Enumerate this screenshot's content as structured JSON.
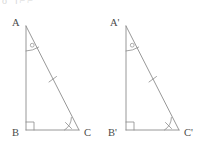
{
  "page": {
    "top_text_fragment": "o  ।⌐⌐"
  },
  "figure": {
    "stroke_color": "#8c8c8c",
    "label_color": "#4a4a4a",
    "background_color": "#ffffff",
    "triangles": [
      {
        "name": "triangle-abc",
        "vertices": {
          "apex": {
            "label": "A",
            "x": 26,
            "y": 26
          },
          "right_angle": {
            "label": "B",
            "x": 26,
            "y": 130
          },
          "base_right": {
            "label": "C",
            "x": 79,
            "y": 130
          }
        },
        "labels": {
          "apex_label": "A",
          "right_angle_label": "B",
          "base_right_label": "C"
        },
        "marks": {
          "apex_angle_mark": "arc-with-circle",
          "right_angle_mark": "square",
          "base_angle_mark": "arc-with-tick",
          "hypotenuse_mark": "single-tick"
        }
      },
      {
        "name": "triangle-a-prime-b-prime-c-prime",
        "vertices": {
          "apex": {
            "label": "A'",
            "x": 126,
            "y": 26
          },
          "right_angle": {
            "label": "B'",
            "x": 126,
            "y": 130
          },
          "base_right": {
            "label": "C'",
            "x": 179,
            "y": 130
          }
        },
        "labels": {
          "apex_label": "A'",
          "right_angle_label": "B'",
          "base_right_label": "C'"
        },
        "marks": {
          "apex_angle_mark": "arc-with-circle",
          "right_angle_mark": "square",
          "base_angle_mark": "arc-with-tick",
          "hypotenuse_mark": "single-tick"
        }
      }
    ]
  }
}
